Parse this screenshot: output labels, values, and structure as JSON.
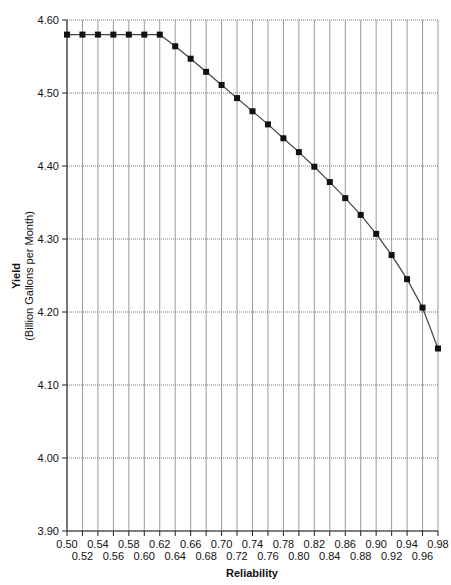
{
  "chart_data": {
    "type": "line",
    "title": "",
    "xlabel": "Reliability",
    "ylabel": "Yield",
    "ylabel_sub": "(Billion Gallons per Month)",
    "xlim": [
      0.5,
      0.98
    ],
    "ylim": [
      3.9,
      4.6
    ],
    "grid": true,
    "legend": null,
    "x_ticks_upper": [
      "0.50",
      "0.54",
      "0.58",
      "0.62",
      "0.66",
      "0.70",
      "0.74",
      "0.78",
      "0.82",
      "0.86",
      "0.90",
      "0.94",
      "0.98"
    ],
    "x_ticks_lower": [
      "0.52",
      "0.56",
      "0.60",
      "0.64",
      "0.68",
      "0.72",
      "0.76",
      "0.80",
      "0.84",
      "0.88",
      "0.92",
      "0.96"
    ],
    "y_ticks": [
      "4.60",
      "4.50",
      "4.40",
      "4.30",
      "4.20",
      "4.10",
      "4.00",
      "3.90"
    ],
    "series": [
      {
        "name": "Yield",
        "marker": "square",
        "color": "#111111",
        "x": [
          0.5,
          0.52,
          0.54,
          0.56,
          0.58,
          0.6,
          0.62,
          0.64,
          0.66,
          0.68,
          0.7,
          0.72,
          0.74,
          0.76,
          0.78,
          0.8,
          0.82,
          0.84,
          0.86,
          0.88,
          0.9,
          0.92,
          0.94,
          0.96,
          0.98
        ],
        "values": [
          4.58,
          4.58,
          4.58,
          4.58,
          4.58,
          4.58,
          4.58,
          4.564,
          4.547,
          4.529,
          4.511,
          4.493,
          4.475,
          4.457,
          4.438,
          4.419,
          4.399,
          4.378,
          4.356,
          4.333,
          4.307,
          4.278,
          4.245,
          4.206,
          4.15
        ]
      }
    ]
  }
}
